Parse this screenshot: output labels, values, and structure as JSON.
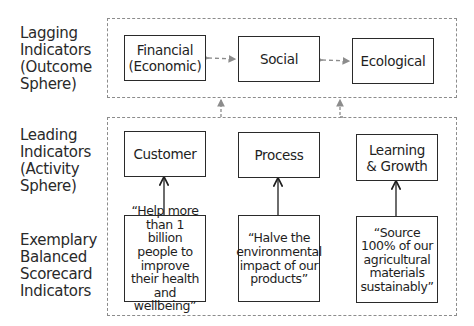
{
  "row_labels": {
    "lagging": "Lagging Indicators (Outcome Sphere)",
    "leading": "Leading Indicators (Activity Sphere)",
    "exemplary": "Exemplary Balanced Scorecard Indicators"
  },
  "outcome_sphere": {
    "boxes": [
      {
        "label": "Financial (Economic)"
      },
      {
        "label": "Social"
      },
      {
        "label": "Ecological"
      }
    ]
  },
  "activity_sphere": {
    "boxes": [
      {
        "label": "Customer"
      },
      {
        "label": "Process"
      },
      {
        "label": "Learning & Growth"
      }
    ]
  },
  "indicators": [
    {
      "quote": "“Help more than 1 billion people to improve their health and wellbeing”"
    },
    {
      "quote": "“Halve the environmental impact of our products”"
    },
    {
      "quote": "“Source 100% of our agricultural materials sustainably”"
    }
  ],
  "colors": {
    "box_border": "#2a2a2a",
    "dashed_border": "#8c8c8c",
    "connector": "#8c8c8c",
    "solid_arrow": "#1e1e1e"
  }
}
